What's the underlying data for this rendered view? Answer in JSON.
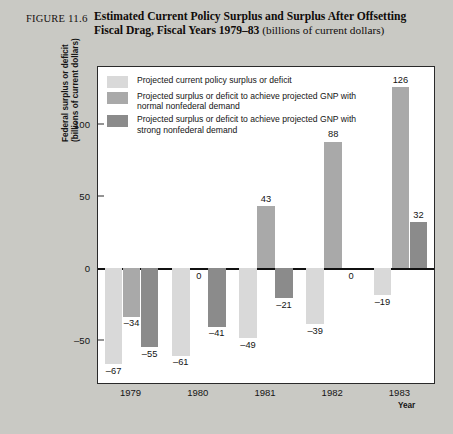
{
  "figure": {
    "label": "FIGURE",
    "number": "11.6",
    "title_line1": "Estimated Current Policy Surplus and Surplus After Offsetting",
    "title_line2": "Fiscal Drag, Fiscal Years 1979–83",
    "subtitle": "(billions of current dollars)"
  },
  "colors": {
    "series1": "#d9d9d9",
    "series2": "#a9a9a9",
    "series3": "#8b8b8b",
    "axis": "#2a2a2a",
    "page_background": "#c9c9c4",
    "plot_background": "#ffffff"
  },
  "axis": {
    "ylabel_line1": "Federal surplus or deficit",
    "ylabel_line2": "(billions of current dollars)",
    "xlabel": "Year",
    "yticks": [
      "100",
      "50",
      "0",
      "-50"
    ]
  },
  "legend": {
    "items": [
      {
        "swatch": "series1",
        "text": "Projected current policy surplus or deficit"
      },
      {
        "swatch": "series2",
        "text": "Projected surplus or deficit to achieve projected GNP with normal nonfederal demand"
      },
      {
        "swatch": "series3",
        "text": "Projected surplus or deficit to achieve projected GNP with strong nonfederal demand"
      }
    ]
  },
  "chart_data": {
    "type": "bar",
    "xlabel": "Year",
    "ylabel": "Federal surplus or deficit (billions of current dollars)",
    "categories": [
      "1979",
      "1980",
      "1981",
      "1982",
      "1983"
    ],
    "ylim": [
      -80,
      140
    ],
    "yticks": [
      -50,
      0,
      50,
      100
    ],
    "grid": false,
    "legend_position": "top-left inside",
    "series": [
      {
        "name": "Projected current policy surplus or deficit",
        "color": "#d9d9d9",
        "values": [
          -67,
          -61,
          -49,
          -39,
          -19
        ],
        "labels": [
          "-67",
          "-61",
          "-49",
          "-39",
          "-19"
        ]
      },
      {
        "name": "Projected surplus or deficit to achieve projected GNP with normal nonfederal demand",
        "color": "#a9a9a9",
        "values": [
          -34,
          0,
          43,
          88,
          126
        ],
        "labels": [
          "-34",
          "0",
          "43",
          "88",
          "126"
        ]
      },
      {
        "name": "Projected surplus or deficit to achieve projected GNP with strong nonfederal demand",
        "color": "#8b8b8b",
        "values": [
          -55,
          -41,
          -21,
          0,
          32
        ],
        "labels": [
          "-55",
          "-41",
          "-21",
          "0",
          "32"
        ]
      }
    ]
  }
}
